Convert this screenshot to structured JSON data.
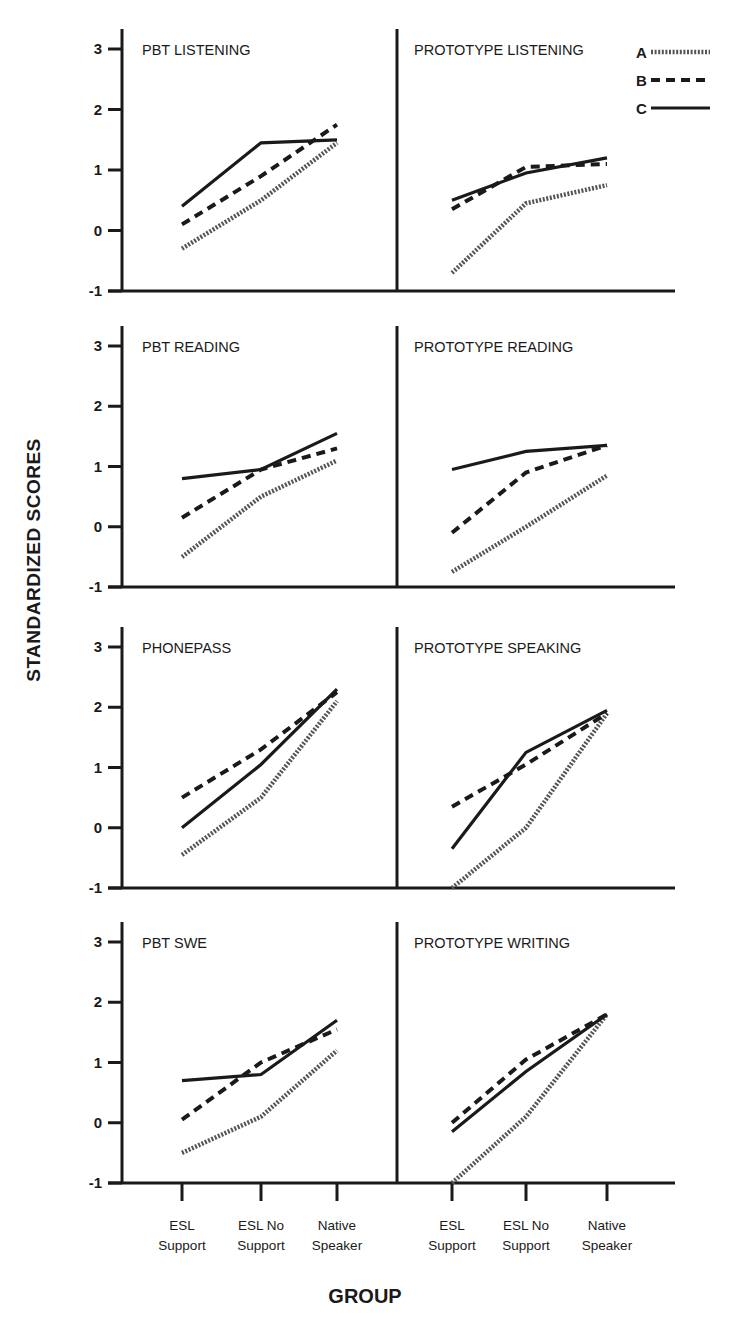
{
  "chart_data": {
    "type": "line",
    "title": "",
    "ylabel": "STANDARDIZED SCORES",
    "xlabel": "GROUP",
    "ylim": [
      -1,
      3
    ],
    "yticks": [
      -1,
      0,
      1,
      2,
      3
    ],
    "categories": [
      "ESL Support",
      "ESL No Support",
      "Native Speaker"
    ],
    "category_lines": [
      [
        "ESL",
        "Support"
      ],
      [
        "ESL No",
        "Support"
      ],
      [
        "Native",
        "Speaker"
      ]
    ],
    "legend": {
      "position": "top-right",
      "entries": [
        {
          "label": "A",
          "style": "dotted"
        },
        {
          "label": "B",
          "style": "dashed"
        },
        {
          "label": "C",
          "style": "solid"
        }
      ]
    },
    "grid": false,
    "panels": [
      {
        "title": "PBT LISTENING",
        "row": 0,
        "col": 0,
        "series": [
          {
            "name": "A",
            "values": [
              -0.3,
              0.5,
              1.45
            ]
          },
          {
            "name": "B",
            "values": [
              0.1,
              0.9,
              1.75
            ]
          },
          {
            "name": "C",
            "values": [
              0.4,
              1.45,
              1.5
            ]
          }
        ]
      },
      {
        "title": "PROTOTYPE LISTENING",
        "row": 0,
        "col": 1,
        "series": [
          {
            "name": "A",
            "values": [
              -0.7,
              0.45,
              0.75
            ]
          },
          {
            "name": "B",
            "values": [
              0.35,
              1.05,
              1.1
            ]
          },
          {
            "name": "C",
            "values": [
              0.5,
              0.95,
              1.2
            ]
          }
        ]
      },
      {
        "title": "PBT READING",
        "row": 1,
        "col": 0,
        "series": [
          {
            "name": "A",
            "values": [
              -0.5,
              0.5,
              1.1
            ]
          },
          {
            "name": "B",
            "values": [
              0.15,
              0.95,
              1.3
            ]
          },
          {
            "name": "C",
            "values": [
              0.8,
              0.95,
              1.55
            ]
          }
        ]
      },
      {
        "title": "PROTOTYPE READING",
        "row": 1,
        "col": 1,
        "series": [
          {
            "name": "A",
            "values": [
              -0.75,
              0.0,
              0.85
            ]
          },
          {
            "name": "B",
            "values": [
              -0.1,
              0.9,
              1.35
            ]
          },
          {
            "name": "C",
            "values": [
              0.95,
              1.25,
              1.35
            ]
          }
        ]
      },
      {
        "title": "PHONEPASS",
        "row": 2,
        "col": 0,
        "series": [
          {
            "name": "A",
            "values": [
              -0.45,
              0.5,
              2.1
            ]
          },
          {
            "name": "B",
            "values": [
              0.5,
              1.3,
              2.25
            ]
          },
          {
            "name": "C",
            "values": [
              0.0,
              1.05,
              2.3
            ]
          }
        ]
      },
      {
        "title": "PROTOTYPE SPEAKING",
        "row": 2,
        "col": 1,
        "series": [
          {
            "name": "A",
            "values": [
              -1.0,
              0.0,
              1.9
            ]
          },
          {
            "name": "B",
            "values": [
              0.35,
              1.05,
              1.9
            ]
          },
          {
            "name": "C",
            "values": [
              -0.35,
              1.25,
              1.95
            ]
          }
        ]
      },
      {
        "title": "PBT SWE",
        "row": 3,
        "col": 0,
        "series": [
          {
            "name": "A",
            "values": [
              -0.5,
              0.1,
              1.2
            ]
          },
          {
            "name": "B",
            "values": [
              0.05,
              1.0,
              1.55
            ]
          },
          {
            "name": "C",
            "values": [
              0.7,
              0.8,
              1.7
            ]
          }
        ]
      },
      {
        "title": "PROTOTYPE WRITING",
        "row": 3,
        "col": 1,
        "series": [
          {
            "name": "A",
            "values": [
              -1.0,
              0.1,
              1.8
            ]
          },
          {
            "name": "B",
            "values": [
              0.0,
              1.05,
              1.8
            ]
          },
          {
            "name": "C",
            "values": [
              -0.15,
              0.85,
              1.8
            ]
          }
        ]
      }
    ]
  }
}
